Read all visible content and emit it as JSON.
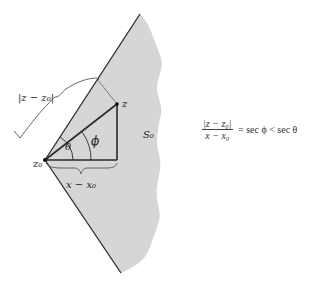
{
  "diagram": {
    "type": "geometry",
    "region_label": "S₀",
    "points": {
      "z0": {
        "label": "z₀",
        "x": 45,
        "y": 160
      },
      "z": {
        "label": "z",
        "x": 117,
        "y": 104
      }
    },
    "segments": {
      "modulus_label": "|z − z₀|",
      "horizontal_label": "x − x₀"
    },
    "angles": {
      "theta": "θ",
      "phi": "ϕ"
    },
    "colors": {
      "region_fill": "#d4d4d4",
      "lines": "#2a2a2a",
      "braces": "#555555"
    }
  },
  "formula": {
    "numerator": "|z − z₀|",
    "denominator": "x − x₀",
    "rest": " = sec ϕ < sec θ"
  }
}
